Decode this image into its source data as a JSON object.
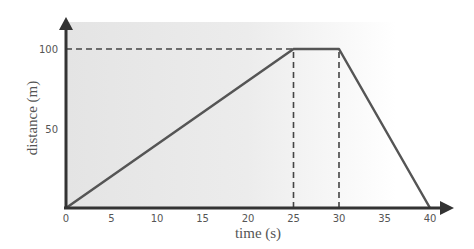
{
  "chart_data": {
    "type": "line",
    "title": "",
    "xlabel": "time (s)",
    "ylabel": "distance (m)",
    "x": [
      0,
      25,
      30,
      40
    ],
    "series": [
      {
        "name": "distance",
        "values": [
          0,
          100,
          100,
          0
        ]
      }
    ],
    "xticks": [
      "0",
      "5",
      "10",
      "15",
      "20",
      "25",
      "30",
      "35",
      "40"
    ],
    "yticks": [
      "50",
      "100"
    ],
    "xlim": [
      0,
      40
    ],
    "ylim": [
      0,
      100
    ],
    "grid": false,
    "legend": null,
    "reference_lines": [
      {
        "type": "horizontal",
        "y": 100,
        "from_x": 0,
        "to_x": 25,
        "style": "dashed"
      },
      {
        "type": "vertical",
        "x": 25,
        "from_y": 0,
        "to_y": 100,
        "style": "dashed"
      },
      {
        "type": "vertical",
        "x": 30,
        "from_y": 0,
        "to_y": 100,
        "style": "dashed"
      }
    ]
  },
  "colors": {
    "line": "#555555",
    "axis": "#333333",
    "background_shade": "#e6e6e6"
  }
}
